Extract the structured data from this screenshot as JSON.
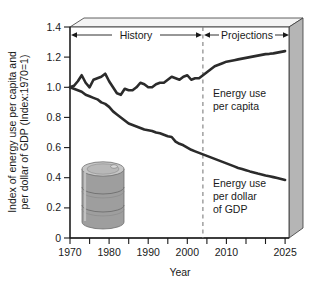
{
  "chart_data": {
    "type": "line",
    "title": "",
    "xlabel": "Year",
    "ylabel": "Index of energy use per capita and per dollar of GDP (Index:1970=1)",
    "ylabel_line1": "Index of energy use per capita and",
    "ylabel_line2": "per dollar of GDP (Index:1970=1)",
    "xlim": [
      1970,
      2026
    ],
    "ylim": [
      0,
      1.4
    ],
    "xticks": [
      1970,
      1975,
      1980,
      1985,
      1990,
      1995,
      2000,
      2005,
      2010,
      2015,
      2020,
      2025
    ],
    "xtick_labels": [
      "1970",
      "",
      "1980",
      "",
      "1990",
      "",
      "2000",
      "",
      "2010",
      "",
      "",
      "2025"
    ],
    "yticks": [
      0,
      0.2,
      0.4,
      0.6,
      0.8,
      1.0,
      1.2,
      1.4
    ],
    "ytick_labels": [
      "0",
      "0.2",
      "0.4",
      "0.6",
      "0.8",
      "1.0",
      "1.2",
      "1.4"
    ],
    "grid": false,
    "legend_position": "inline-annotation",
    "divider_year": 2003,
    "annotations": [
      {
        "name": "history",
        "label": "History",
        "from": 1970,
        "to": 2003
      },
      {
        "name": "projections",
        "label": "Projections",
        "from": 2003,
        "to": 2026
      }
    ],
    "series": [
      {
        "name": "energy-use-per-capita",
        "label": "Energy use per capita",
        "label_line1": "Energy use",
        "label_line2": "per capita",
        "x": [
          1970,
          1971,
          1972,
          1973,
          1974,
          1975,
          1976,
          1977,
          1978,
          1979,
          1980,
          1981,
          1982,
          1983,
          1984,
          1985,
          1986,
          1987,
          1988,
          1989,
          1990,
          1991,
          1992,
          1993,
          1994,
          1995,
          1996,
          1997,
          1998,
          1999,
          2000,
          2001,
          2002,
          2003,
          2004,
          2005,
          2006,
          2007,
          2008,
          2009,
          2010,
          2011,
          2012,
          2013,
          2014,
          2015,
          2016,
          2017,
          2018,
          2019,
          2020,
          2021,
          2022,
          2023,
          2024,
          2025
        ],
        "y": [
          1.0,
          1.01,
          1.04,
          1.08,
          1.03,
          1.0,
          1.05,
          1.06,
          1.07,
          1.09,
          1.04,
          1.0,
          0.96,
          0.95,
          0.99,
          0.98,
          0.98,
          1.0,
          1.03,
          1.02,
          1.0,
          1.0,
          1.02,
          1.03,
          1.03,
          1.05,
          1.07,
          1.06,
          1.05,
          1.07,
          1.08,
          1.05,
          1.06,
          1.06,
          1.08,
          1.1,
          1.12,
          1.14,
          1.15,
          1.16,
          1.17,
          1.175,
          1.18,
          1.185,
          1.19,
          1.195,
          1.2,
          1.205,
          1.21,
          1.215,
          1.22,
          1.222,
          1.225,
          1.23,
          1.235,
          1.24
        ]
      },
      {
        "name": "energy-use-per-dollar-gdp",
        "label": "Energy use per dollar of GDP",
        "label_line1": "Energy use",
        "label_line2": "per dollar",
        "label_line3": "of GDP",
        "x": [
          1970,
          1971,
          1972,
          1973,
          1974,
          1975,
          1976,
          1977,
          1978,
          1979,
          1980,
          1981,
          1982,
          1983,
          1984,
          1985,
          1986,
          1987,
          1988,
          1989,
          1990,
          1991,
          1992,
          1993,
          1994,
          1995,
          1996,
          1997,
          1998,
          1999,
          2000,
          2001,
          2002,
          2003,
          2004,
          2005,
          2006,
          2007,
          2008,
          2009,
          2010,
          2011,
          2012,
          2013,
          2014,
          2015,
          2016,
          2017,
          2018,
          2019,
          2020,
          2021,
          2022,
          2023,
          2024,
          2025
        ],
        "y": [
          1.0,
          0.99,
          0.98,
          0.97,
          0.95,
          0.94,
          0.93,
          0.92,
          0.9,
          0.89,
          0.87,
          0.84,
          0.82,
          0.8,
          0.78,
          0.76,
          0.75,
          0.74,
          0.73,
          0.72,
          0.715,
          0.71,
          0.7,
          0.695,
          0.685,
          0.675,
          0.67,
          0.64,
          0.625,
          0.615,
          0.6,
          0.585,
          0.575,
          0.565,
          0.555,
          0.545,
          0.535,
          0.525,
          0.515,
          0.505,
          0.495,
          0.485,
          0.475,
          0.465,
          0.458,
          0.45,
          0.442,
          0.435,
          0.428,
          0.422,
          0.415,
          0.41,
          0.404,
          0.398,
          0.392,
          0.385
        ]
      }
    ]
  },
  "figure": {
    "barrel_name": "oil-barrel-illustration",
    "panel_3d": true
  },
  "colors": {
    "line": "#2b2b2b",
    "axis": "#1a1a1a",
    "panel_side": "#b3b3b3",
    "panel_top": "#f2f2f2",
    "barrel_body": "#9a9a9a",
    "barrel_top": "#c4c4c4",
    "divider": "#8a8a8a",
    "background": "#ffffff"
  }
}
